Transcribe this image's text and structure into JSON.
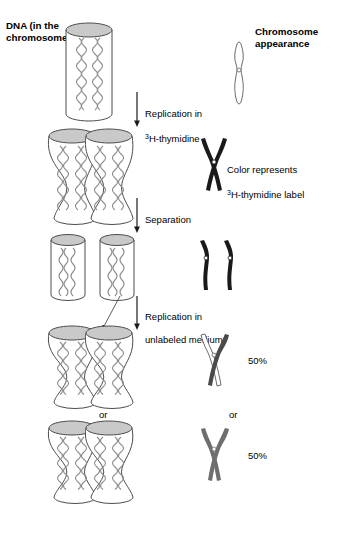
{
  "figure": {
    "title_left": "DNA (in the\nchromosome)",
    "title_right": "Chromosome\nappearance",
    "background": "#ffffff",
    "width": 358,
    "height": 534
  },
  "colors": {
    "outline": "#4d4d4d",
    "cap_fill": "#c9c9c9",
    "dna_strand": "#808080",
    "labeled_dark": "#1a1a1a",
    "labeled_medium": "#6e6e6e",
    "unlabeled_light": "#ffffff",
    "text": "#000000"
  },
  "steps": [
    {
      "id": "replication-in-h3-thymidine",
      "label_line1": "Replication in",
      "label_line2_sup": "3",
      "label_line2": "H-thymidine",
      "arrow": "down"
    },
    {
      "id": "separation",
      "label_line1": "Separation",
      "label_line2_sup": "",
      "label_line2": "",
      "arrow": "down"
    },
    {
      "id": "replication-in-unlabeled-medium",
      "label_line1": "Replication in",
      "label_line2_sup": "",
      "label_line2": "unlabeled medium",
      "arrow": "down"
    }
  ],
  "annotations": {
    "color_represents_line1": "Color represents",
    "color_represents_sup": "3",
    "color_represents_line2": "H-thymidine label",
    "or_left": "or",
    "or_right": "or",
    "percent_top": "50%",
    "percent_bottom": "50%"
  },
  "stages": [
    {
      "id": "stage-1-unreplicated",
      "dna_description": "single cylinder with unlabeled double helix",
      "chromosome_description": "thin unlabeled (white) single chromosome with centromere",
      "labeled": false
    },
    {
      "id": "stage-2-replicated-labeled",
      "dna_description": "two joined hourglass cylinders, both containing labeled DNA",
      "chromosome_description": "X-shaped chromosome, both chromatids dark (labeled)",
      "labeled": true
    },
    {
      "id": "stage-3-separated",
      "dna_description": "two separate cylinders each with labeled DNA",
      "chromosome_description": "two separate dark (labeled) chromosomes",
      "labeled": true
    },
    {
      "id": "stage-4a-50-percent",
      "dna_description": "two joined hourglass cylinders after unlabeled replication",
      "chromosome_description": "X-shaped chromosome, one chromatid white (unlabeled), one dark (labeled)",
      "percent": "50%",
      "labeled": "mixed"
    },
    {
      "id": "stage-4b-50-percent",
      "dna_description": "two joined hourglass cylinders after unlabeled replication",
      "chromosome_description": "X-shaped chromosome, both chromatids medium gray (half labeled)",
      "percent": "50%",
      "labeled": "mixed"
    }
  ]
}
